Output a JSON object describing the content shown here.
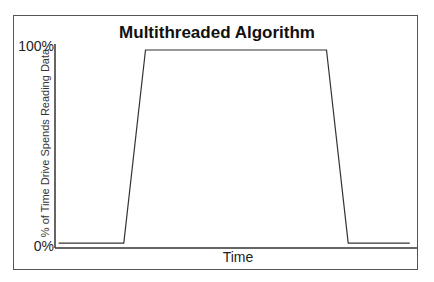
{
  "chart_data": {
    "type": "line",
    "title": "Multithreaded Algorithm",
    "xlabel": "Time",
    "ylabel": "% of Time Drive Spends Reading Data",
    "y_ticks": [
      "0%",
      "100%"
    ],
    "ylim": [
      0,
      100
    ],
    "x_ticks": [],
    "grid": false,
    "legend": null,
    "series": [
      {
        "name": "Multithreaded Algorithm",
        "x": [
          0.01,
          0.19,
          0.25,
          0.75,
          0.81,
          0.98
        ],
        "values": [
          2,
          2,
          100,
          100,
          2,
          2
        ]
      }
    ],
    "colors": {
      "line": "#333333",
      "axis": "#333333",
      "frame": "#555555"
    }
  }
}
